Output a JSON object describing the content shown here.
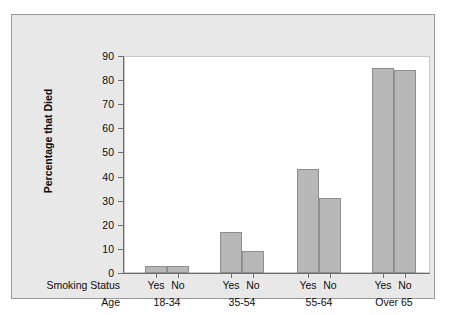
{
  "chart_data": {
    "type": "bar",
    "title": "",
    "xlabel": "",
    "ylabel": "Percentage that Died",
    "ylim": [
      0,
      90
    ],
    "yticks": [
      0,
      10,
      20,
      30,
      40,
      50,
      60,
      70,
      80,
      90
    ],
    "ytick_labels": [
      "0",
      "10",
      "20",
      "30",
      "40",
      "50",
      "60",
      "70",
      "80",
      "90"
    ],
    "grid": false,
    "legend": "none",
    "axis_row_labels": {
      "row1": "Smoking Status",
      "row2": "Age"
    },
    "categories": [
      "18-34",
      "35-54",
      "55-64",
      "Over 65"
    ],
    "subcategories": [
      "Yes",
      "No"
    ],
    "series": [
      {
        "name": "Yes",
        "values": [
          3,
          17,
          43,
          85
        ]
      },
      {
        "name": "No",
        "values": [
          3,
          9,
          31,
          84
        ]
      }
    ],
    "groups": [
      {
        "age": "18-34",
        "bars": [
          {
            "label": "Yes",
            "value": 3
          },
          {
            "label": "No",
            "value": 3
          }
        ]
      },
      {
        "age": "35-54",
        "bars": [
          {
            "label": "Yes",
            "value": 17
          },
          {
            "label": "No",
            "value": 9
          }
        ]
      },
      {
        "age": "55-64",
        "bars": [
          {
            "label": "Yes",
            "value": 43
          },
          {
            "label": "No",
            "value": 31
          }
        ]
      },
      {
        "age": "Over 65",
        "bars": [
          {
            "label": "Yes",
            "value": 85
          },
          {
            "label": "No",
            "value": 84
          }
        ]
      }
    ],
    "colors": {
      "bar_fill": "#b8b8b8",
      "bar_edge": "#8f8f8f",
      "plot_background": "#ffffff",
      "figure_background": "#e8e8e8",
      "axis": "#6e6e6e",
      "text": "#0d0d0d"
    }
  }
}
